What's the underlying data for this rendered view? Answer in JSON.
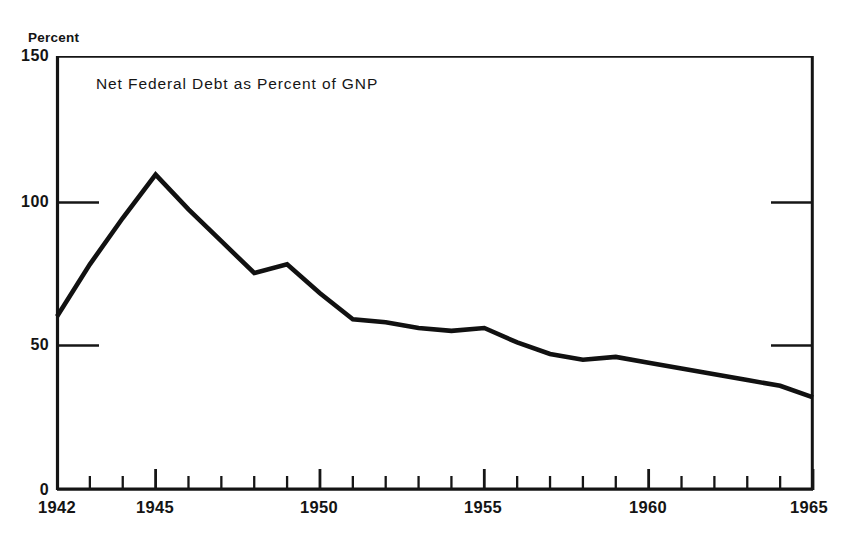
{
  "figure": {
    "clipped_header_text": "Chart 7.  Net Federal Debt as Percent of GNP",
    "unit_label": "Percent",
    "series_caption": "Net Federal Debt as Percent of GNP",
    "line_color": "#111111",
    "axis_color": "#141414",
    "background_color": "#ffffff"
  },
  "chart_data": {
    "type": "line",
    "title": "Net Federal Debt as Percent of GNP",
    "xlabel": "",
    "ylabel": "Percent",
    "xlim": [
      1942,
      1965
    ],
    "ylim": [
      0,
      150
    ],
    "yticks": [
      0,
      50,
      100,
      150
    ],
    "ytick_labels": [
      "0",
      "50",
      "100",
      "150"
    ],
    "xticks": [
      1942,
      1943,
      1944,
      1945,
      1946,
      1947,
      1948,
      1949,
      1950,
      1951,
      1952,
      1953,
      1954,
      1955,
      1956,
      1957,
      1958,
      1959,
      1960,
      1961,
      1962,
      1963,
      1964,
      1965
    ],
    "xtick_labels_shown": [
      "1942",
      "1945",
      "1950",
      "1955",
      "1960",
      "1965"
    ],
    "major_xticks": [
      1945,
      1950,
      1955,
      1960,
      1965
    ],
    "grid": false,
    "gridline_stubs_at": [
      50,
      100
    ],
    "legend": null,
    "series": [
      {
        "name": "Net Federal Debt as Percent of GNP",
        "x": [
          1942,
          1943,
          1944,
          1945,
          1946,
          1947,
          1948,
          1949,
          1950,
          1951,
          1952,
          1953,
          1954,
          1955,
          1956,
          1957,
          1958,
          1959,
          1960,
          1961,
          1962,
          1963,
          1964,
          1965
        ],
        "values": [
          60,
          78,
          94,
          109,
          97,
          86,
          75,
          78,
          68,
          59,
          58,
          56,
          55,
          56,
          51,
          47,
          45,
          46,
          44,
          42,
          40,
          38,
          36,
          32
        ]
      }
    ]
  },
  "axes_geometry": {
    "plot_left": 57,
    "plot_right": 813,
    "plot_top": 56,
    "plot_bottom": 490
  }
}
